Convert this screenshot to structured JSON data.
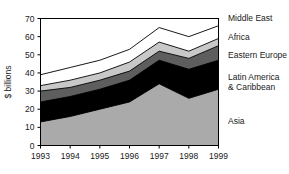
{
  "chart_data": {
    "type": "area",
    "stacked": true,
    "title": "",
    "subtitle": "",
    "xlabel": "",
    "ylabel": "$ billions",
    "categories": [
      "1993",
      "1994",
      "1995",
      "1996",
      "1997",
      "1998",
      "1999"
    ],
    "x": [
      1993,
      1994,
      1995,
      1996,
      1997,
      1998,
      1999
    ],
    "xlim": [
      1993,
      1999
    ],
    "ylim": [
      0,
      70
    ],
    "y_ticks": [
      0,
      10,
      20,
      30,
      40,
      50,
      60,
      70
    ],
    "y_tick_labels": [
      "0",
      "10",
      "20",
      "30",
      "40",
      "50",
      "60",
      "70"
    ],
    "grid": false,
    "legend_position": "right",
    "series": [
      {
        "name": "Asia",
        "color": "#aaaaaa",
        "values": [
          13,
          16,
          20,
          24,
          34,
          26,
          31
        ]
      },
      {
        "name": "Latin America & Caribbean",
        "color": "#000000",
        "values": [
          11,
          11,
          11,
          12,
          13,
          16,
          16
        ]
      },
      {
        "name": "Eastern Europe",
        "color": "#5e5e5e",
        "values": [
          6,
          5,
          5,
          5,
          5,
          6,
          8
        ]
      },
      {
        "name": "Africa",
        "color": "#c8c8c8",
        "values": [
          3,
          4,
          4,
          5,
          5,
          4,
          4
        ]
      },
      {
        "name": "Middle East",
        "color": "#ffffff",
        "values": [
          6,
          7,
          7,
          7,
          8,
          8,
          7
        ]
      }
    ],
    "cumulative_tops": {
      "Asia": [
        13,
        16,
        20,
        24,
        34,
        26,
        31
      ],
      "Latin America & Caribbean": [
        24,
        27,
        31,
        36,
        47,
        42,
        47
      ],
      "Eastern Europe": [
        30,
        32,
        36,
        41,
        52,
        48,
        55
      ],
      "Africa": [
        33,
        36,
        40,
        46,
        57,
        52,
        59
      ],
      "Middle East": [
        39,
        43,
        47,
        53,
        65,
        60,
        66
      ]
    },
    "annotations": []
  },
  "legend": {
    "entries": [
      {
        "label": "Middle East"
      },
      {
        "label": "Africa"
      },
      {
        "label": "Eastern Europe"
      },
      {
        "label": "Latin America & Caribbean"
      },
      {
        "label": "Latin America",
        "line2": "& Caribbean"
      },
      {
        "label": "Asia"
      }
    ],
    "middle_east": "Middle East",
    "africa": "Africa",
    "eastern_europe": "Eastern Europe",
    "latin_america_line1": "Latin America",
    "latin_america_line2": "& Caribbean",
    "asia": "Asia"
  },
  "axes": {
    "y_label": "$ billions",
    "y_ticks": [
      "70",
      "60",
      "50",
      "40",
      "30",
      "20",
      "10",
      "0"
    ],
    "x_ticks": [
      "1993",
      "1994",
      "1995",
      "1996",
      "1997",
      "1998",
      "1999"
    ]
  },
  "colors": {
    "asia": "#aaaaaa",
    "latin_america": "#000000",
    "eastern_europe": "#5e5e5e",
    "africa": "#c8c8c8",
    "middle_east": "#ffffff",
    "axis": "#000000",
    "text": "#1a1a1a",
    "background": "#ffffff"
  }
}
